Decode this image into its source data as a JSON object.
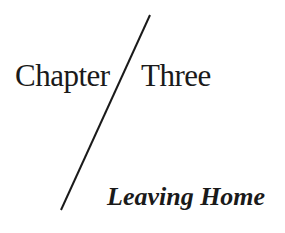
{
  "heading": {
    "chapter_label": "Chapter",
    "chapter_number": "Three"
  },
  "subtitle": "Leaving Home",
  "colors": {
    "ink": "#1a1a1a",
    "background": "#ffffff"
  }
}
